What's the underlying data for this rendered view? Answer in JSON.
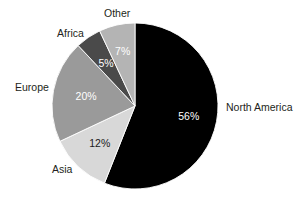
{
  "chart_data": {
    "type": "pie",
    "title": "",
    "subtitle": "",
    "xlabel": "",
    "ylabel": "",
    "grid": false,
    "legend_position": "none",
    "label_style": "outside-category-inside-percent",
    "units": "percent",
    "total": 100,
    "start_angle_deg": 0,
    "direction": "clockwise",
    "categories": [
      "North America",
      "Asia",
      "Europe",
      "Africa",
      "Other"
    ],
    "values": [
      56,
      12,
      20,
      5,
      7
    ],
    "value_labels": [
      "56%",
      "12%",
      "20%",
      "5%",
      "7%"
    ],
    "colors": [
      "#000000",
      "#d8d8d8",
      "#9a9a9a",
      "#4a4a4a",
      "#b4b4b4"
    ],
    "slices": [
      {
        "name": "North America",
        "value": 56,
        "value_label": "56%",
        "color": "#000000",
        "label_text_color": "#ffffff",
        "start_deg": 0,
        "end_deg": 201.6
      },
      {
        "name": "Asia",
        "value": 12,
        "value_label": "12%",
        "color": "#d8d8d8",
        "label_text_color": "#1a1a1a",
        "start_deg": 201.6,
        "end_deg": 244.8
      },
      {
        "name": "Europe",
        "value": 20,
        "value_label": "20%",
        "color": "#9a9a9a",
        "label_text_color": "#ffffff",
        "start_deg": 244.8,
        "end_deg": 316.8
      },
      {
        "name": "Africa",
        "value": 5,
        "value_label": "5%",
        "color": "#4a4a4a",
        "label_text_color": "#ffffff",
        "start_deg": 316.8,
        "end_deg": 334.8
      },
      {
        "name": "Other",
        "value": 7,
        "value_label": "7%",
        "color": "#b4b4b4",
        "label_text_color": "#ffffff",
        "start_deg": 334.8,
        "end_deg": 360
      }
    ]
  },
  "labels": {
    "north_america": "North America",
    "asia": "Asia",
    "europe": "Europe",
    "africa": "Africa",
    "other": "Other"
  },
  "value_text": {
    "north_america": "56%",
    "asia": "12%",
    "europe": "20%",
    "africa": "5%",
    "other": "7%"
  },
  "geometry": {
    "center_x": 135,
    "center_y": 106,
    "radius": 83
  }
}
